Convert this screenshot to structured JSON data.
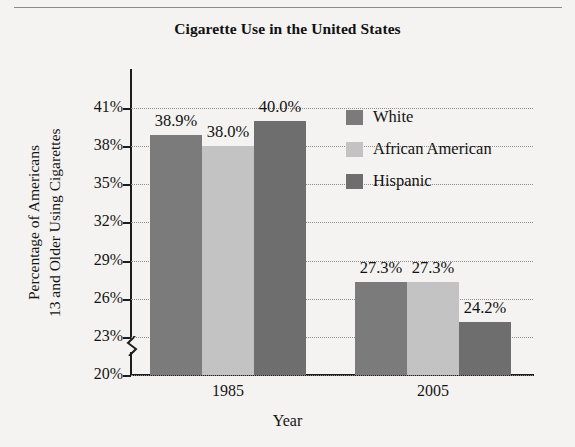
{
  "figure": {
    "title": "Cigarette Use in the United States"
  },
  "legend": {
    "items": [
      {
        "label": "White",
        "color": "#7b7b7b"
      },
      {
        "label": "African American",
        "color": "#c3c3c3"
      },
      {
        "label": "Hispanic",
        "color": "#6e6e6e"
      }
    ]
  },
  "axes": {
    "ylabel_line1": "Percentage of Americans",
    "ylabel_line2": "13 and Older Using Cigarettes",
    "xlabel": "Year",
    "ytick_labels": [
      "41%",
      "38%",
      "35%",
      "32%",
      "29%",
      "26%",
      "23%",
      "20%"
    ],
    "xtick_labels": [
      "1985",
      "2005"
    ],
    "axis_break": "axis-break-zigzag"
  },
  "chart_data": {
    "type": "bar",
    "title": "Cigarette Use in the United States",
    "xlabel": "Year",
    "ylabel": "Percentage of Americans 13 and Older Using Cigarettes",
    "categories": [
      "1985",
      "2005"
    ],
    "series": [
      {
        "name": "White",
        "color": "#7b7b7b",
        "values": [
          38.9,
          27.3
        ],
        "labels": [
          "38.9%",
          "27.3%"
        ]
      },
      {
        "name": "African American",
        "color": "#c3c3c3",
        "values": [
          38.0,
          27.3
        ],
        "labels": [
          "38.0%",
          "27.3%"
        ]
      },
      {
        "name": "Hispanic",
        "color": "#6e6e6e",
        "values": [
          40.0,
          24.2
        ],
        "labels": [
          "40.0%",
          "24.2%"
        ]
      }
    ],
    "ylim": [
      20,
      41
    ],
    "ytick_step": 3,
    "yticks": [
      20,
      23,
      26,
      29,
      32,
      35,
      38,
      41
    ],
    "grid": true,
    "grid_style": "dotted-horizontal",
    "y_axis_broken_below": 20,
    "legend_position": "inside-upper-right",
    "bar_value_labels": true
  }
}
